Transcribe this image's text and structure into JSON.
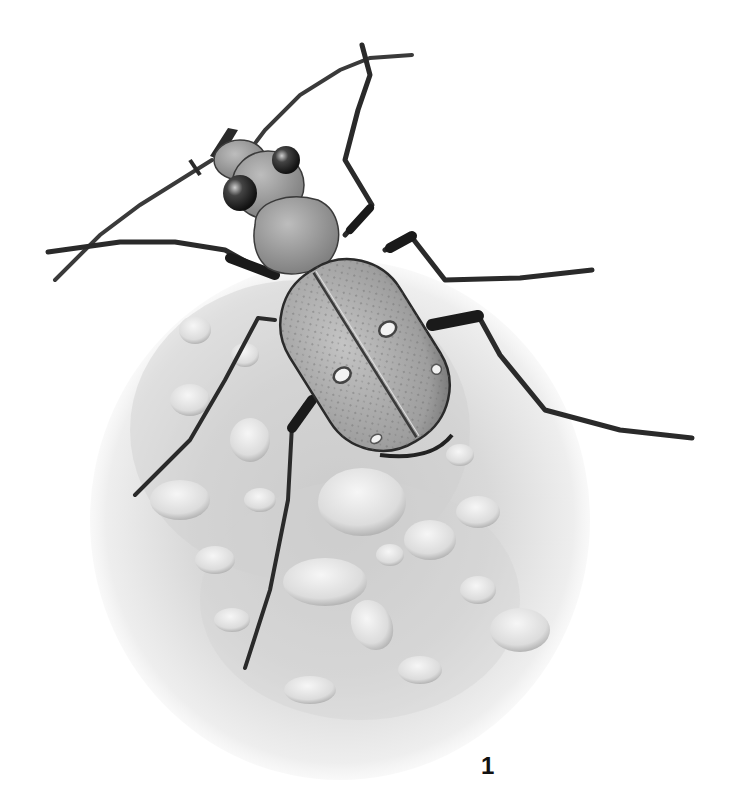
{
  "figure": {
    "label": "1",
    "style": "monochrome graphite illustration"
  },
  "colors": {
    "background": "#ffffff",
    "ink_dark": "#1a1a1a",
    "body_mid": "#8a8a8a",
    "elytra_fill": "#a9a9a9",
    "sand": "#d8d8d8",
    "pebble": "#e6e6e6"
  }
}
